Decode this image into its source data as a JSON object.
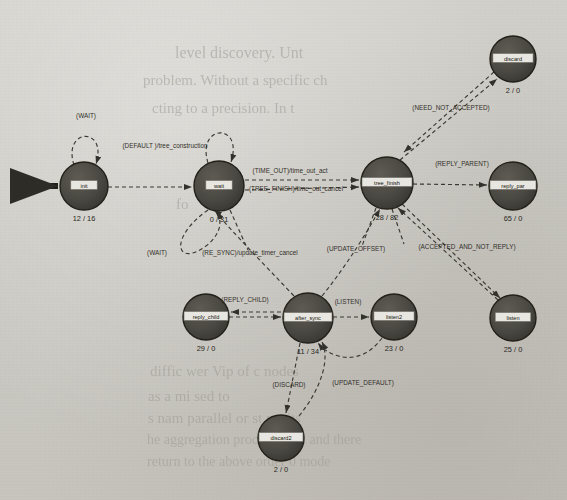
{
  "diagram": {
    "node_fill": "#4c4a44",
    "node_stroke": "#232019",
    "label_box_fill": "#e8e6e0",
    "edge_color": "#3a3832",
    "text_color": "#32302a",
    "nodes": [
      {
        "id": "init",
        "label": "init",
        "counts": "12 / 16",
        "cx": 84,
        "cy": 186,
        "r": 24
      },
      {
        "id": "wait",
        "label": "wait",
        "counts": "0 / 31",
        "cx": 219,
        "cy": 186,
        "r": 25
      },
      {
        "id": "tree_finish",
        "label": "tree_finish",
        "counts": "28 / 82",
        "cx": 387,
        "cy": 183,
        "r": 26
      },
      {
        "id": "discard",
        "label": "discard",
        "counts": "2 / 0",
        "cx": 513,
        "cy": 59,
        "r": 23
      },
      {
        "id": "reply_par",
        "label": "reply_par",
        "counts": "65 / 0",
        "cx": 513,
        "cy": 186,
        "r": 24
      },
      {
        "id": "listen",
        "label": "listen",
        "counts": "25 / 0",
        "cx": 513,
        "cy": 318,
        "r": 23
      },
      {
        "id": "reply_child",
        "label": "reply_child",
        "counts": "29 / 0",
        "cx": 206,
        "cy": 317,
        "r": 23
      },
      {
        "id": "after_sync",
        "label": "after_sync",
        "counts": "11 / 34",
        "cx": 308,
        "cy": 318,
        "r": 25
      },
      {
        "id": "listen2",
        "label": "listen2",
        "counts": "23 / 0",
        "cx": 394,
        "cy": 317,
        "r": 23
      },
      {
        "id": "discard2",
        "label": "discard2",
        "counts": "2 / 0",
        "cx": 281,
        "cy": 438,
        "r": 23
      }
    ],
    "start_marker": {
      "label": "initial-state-arrow",
      "x": 31,
      "y": 186
    },
    "edges": [
      {
        "id": "init-self",
        "label": "(WAIT)",
        "lx": 86,
        "ly": 118
      },
      {
        "id": "init-to-wait",
        "label": "(DEFAULT )/tree_construction",
        "lx": 165,
        "ly": 148
      },
      {
        "id": "wait-self",
        "label": "(WAIT)",
        "lx": 157,
        "ly": 255
      },
      {
        "id": "wait-to-tree-finish-1",
        "label": "(TIME_OUT)/time_out_act",
        "lx": 290,
        "ly": 173
      },
      {
        "id": "wait-to-tree-finish-2",
        "label": "(TREE_FINISH)/time_out_cancel",
        "lx": 296,
        "ly": 191
      },
      {
        "id": "tree-finish-to-discard",
        "label": "(NEED_NOT_ACCEPTED)",
        "lx": 451,
        "ly": 110
      },
      {
        "id": "tree-finish-to-reply",
        "label": "(REPLY_PARENT)",
        "lx": 462,
        "ly": 166
      },
      {
        "id": "tree-finish-to-listen",
        "label": "(ACCEPTED_AND_NOT_REPLY)",
        "lx": 467,
        "ly": 249
      },
      {
        "id": "after-sync-to-wait",
        "label": "(RE_SYNC)/update_timer_cancel",
        "lx": 250,
        "ly": 255
      },
      {
        "id": "after-sync-to-tf",
        "label": "(UPDATE_OFFSET)",
        "lx": 356,
        "ly": 251
      },
      {
        "id": "reply-child-to-after",
        "label": "(REPLY_CHILD)",
        "lx": 245,
        "ly": 302
      },
      {
        "id": "after-sync-to-listen2",
        "label": "(LISTEN)",
        "lx": 348,
        "ly": 304
      },
      {
        "id": "after-sync-to-discard2",
        "label": "(DISCARD)",
        "lx": 289,
        "ly": 387
      },
      {
        "id": "discard2-to-after",
        "label": "(UPDATE_DEFAULT)",
        "lx": 363,
        "ly": 385
      }
    ]
  },
  "bleed_through": [
    {
      "text": "level discovery.  Unt",
      "x": 175,
      "y": 44,
      "size": 16
    },
    {
      "text": "problem. Without a specific ch",
      "x": 143,
      "y": 72,
      "size": 15
    },
    {
      "text": "cting to a precision. In t",
      "x": 152,
      "y": 100,
      "size": 15
    },
    {
      "text": "fo",
      "x": 176,
      "y": 196,
      "size": 15
    },
    {
      "text": "diffic  wer  Vip  of  c   nodes",
      "x": 150,
      "y": 363,
      "size": 15
    },
    {
      "text": "as a  mi   sed  to",
      "x": 148,
      "y": 388,
      "size": 15
    },
    {
      "text": "s  nam  parallel or st  posits",
      "x": 148,
      "y": 410,
      "size": 15
    },
    {
      "text": "he  aggregation process  level and there",
      "x": 147,
      "y": 432,
      "size": 14
    },
    {
      "text": "return to the above order 0  mode",
      "x": 147,
      "y": 454,
      "size": 14
    }
  ]
}
